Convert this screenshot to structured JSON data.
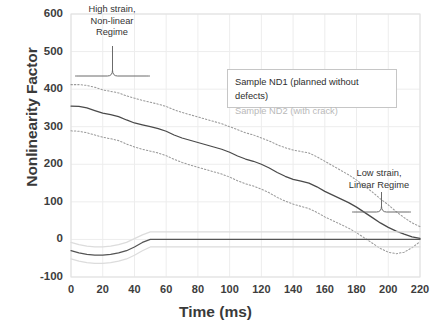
{
  "chart_data": {
    "type": "line",
    "title": "",
    "xlabel": "Time (ms)",
    "ylabel": "Nonlinearity Factor",
    "xlim": [
      0,
      220
    ],
    "ylim": [
      -100,
      600
    ],
    "xticks": [
      "0",
      "20",
      "40",
      "60",
      "80",
      "100",
      "120",
      "140",
      "160",
      "180",
      "200",
      "220"
    ],
    "yticks": [
      "600",
      "500",
      "400",
      "300",
      "200",
      "100",
      "0",
      "-100"
    ],
    "grid": true,
    "legend_position": "upper-right-inside",
    "legend": [
      {
        "label": "Sample ND1 (planned without defects)",
        "color": "#2d2d2d"
      },
      {
        "label": "Sample ND2 (with crack)",
        "color": "#b9b9b9"
      }
    ],
    "annotations": [
      {
        "text": "High strain,\nNon-linear\nRegime",
        "x_range": [
          0,
          50
        ]
      },
      {
        "text": "Low strain,\nLinear Regime",
        "x_range": [
          185,
          220
        ]
      }
    ],
    "x": [
      0,
      5,
      10,
      15,
      20,
      25,
      30,
      35,
      40,
      45,
      50,
      55,
      60,
      65,
      70,
      75,
      80,
      85,
      90,
      95,
      100,
      105,
      110,
      115,
      120,
      125,
      130,
      135,
      140,
      145,
      150,
      155,
      160,
      165,
      170,
      175,
      180,
      185,
      190,
      195,
      200,
      205,
      210,
      215,
      220
    ],
    "series": [
      {
        "name": "Sample ND1 (planned without defects)",
        "style": "solid",
        "color": "#4a4a4a",
        "values": [
          355,
          354,
          350,
          343,
          336,
          332,
          327,
          318,
          310,
          305,
          300,
          295,
          288,
          278,
          270,
          264,
          258,
          252,
          246,
          240,
          232,
          222,
          214,
          208,
          200,
          190,
          178,
          168,
          160,
          155,
          150,
          140,
          128,
          118,
          108,
          98,
          86,
          72,
          58,
          44,
          32,
          22,
          14,
          7,
          3
        ]
      },
      {
        "name": "Sample ND1 upper band",
        "style": "dotted",
        "color": "#9a9a9a",
        "values": [
          412,
          412,
          410,
          405,
          398,
          394,
          390,
          382,
          376,
          370,
          365,
          360,
          354,
          345,
          338,
          332,
          326,
          320,
          314,
          308,
          300,
          292,
          284,
          278,
          270,
          262,
          252,
          244,
          238,
          234,
          230,
          220,
          208,
          196,
          184,
          172,
          158,
          142,
          126,
          108,
          92,
          74,
          58,
          44,
          34
        ]
      },
      {
        "name": "Sample ND1 lower band",
        "style": "dotted",
        "color": "#9a9a9a",
        "values": [
          289,
          288,
          284,
          278,
          272,
          268,
          263,
          254,
          246,
          240,
          235,
          230,
          223,
          213,
          205,
          198,
          192,
          186,
          180,
          174,
          166,
          156,
          148,
          142,
          134,
          124,
          112,
          102,
          94,
          88,
          82,
          72,
          60,
          50,
          40,
          30,
          18,
          4,
          -10,
          -24,
          -34,
          -38,
          -34,
          -22,
          -6
        ]
      },
      {
        "name": "Sample ND2 (with crack)",
        "style": "solid",
        "color": "#555555",
        "values": [
          -30,
          -36,
          -40,
          -42,
          -42,
          -40,
          -36,
          -30,
          -20,
          -8,
          0,
          0,
          0,
          0,
          0,
          0,
          0,
          0,
          0,
          0,
          0,
          0,
          0,
          0,
          0,
          0,
          0,
          0,
          0,
          0,
          0,
          0,
          0,
          0,
          0,
          0,
          0,
          0,
          0,
          0,
          0,
          0,
          0,
          0,
          0
        ]
      },
      {
        "name": "Sample ND2 upper band",
        "style": "solid",
        "color": "#dcdcdc",
        "values": [
          -8,
          -14,
          -18,
          -20,
          -20,
          -18,
          -14,
          -8,
          2,
          12,
          20,
          20,
          20,
          20,
          20,
          20,
          20,
          20,
          20,
          20,
          20,
          20,
          20,
          20,
          20,
          20,
          20,
          20,
          20,
          20,
          20,
          20,
          20,
          20,
          20,
          20,
          20,
          20,
          20,
          20,
          20,
          20,
          20,
          20,
          20
        ]
      },
      {
        "name": "Sample ND2 lower band",
        "style": "solid",
        "color": "#dcdcdc",
        "values": [
          -52,
          -58,
          -62,
          -64,
          -64,
          -62,
          -58,
          -52,
          -42,
          -30,
          -20,
          -20,
          -20,
          -20,
          -20,
          -20,
          -20,
          -20,
          -20,
          -20,
          -20,
          -20,
          -20,
          -20,
          -20,
          -20,
          -20,
          -20,
          -20,
          -20,
          -20,
          -20,
          -20,
          -20,
          -20,
          -20,
          -20,
          -20,
          -20,
          -20,
          -20,
          -20,
          -20,
          -20,
          -20
        ]
      }
    ]
  },
  "axis": {
    "xlabel": "Time (ms)",
    "ylabel": "Nonlinearity Factor"
  },
  "annotations": {
    "high_strain": "High strain,\nNon-linear\nRegime",
    "low_strain": "Low strain,\nLinear Regime"
  },
  "legend": {
    "nd1": "Sample ND1 (planned without defects)",
    "nd2": "Sample ND2 (with crack)"
  }
}
